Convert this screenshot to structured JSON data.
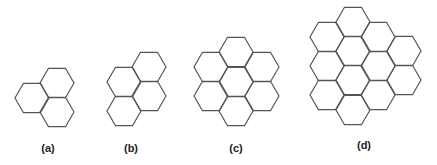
{
  "figures": [
    {
      "id": "a",
      "label": "(a)",
      "cell_count": 3
    },
    {
      "id": "b",
      "label": "(b)",
      "cell_count": 4
    },
    {
      "id": "c",
      "label": "(c)",
      "cell_count": 7
    },
    {
      "id": "d",
      "label": "(d)",
      "cell_count": 12
    }
  ],
  "colors": {
    "stroke": "#555555",
    "label": "#222222",
    "background": "#ffffff"
  }
}
